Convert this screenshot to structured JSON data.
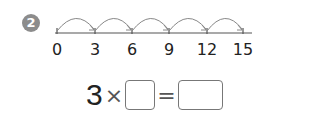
{
  "problem": {
    "number": "2"
  },
  "number_line": {
    "ticks": [
      "0",
      "3",
      "6",
      "9",
      "12",
      "15"
    ],
    "tick_x": [
      57,
      95,
      132,
      169,
      207,
      243
    ],
    "line_start_x": 55,
    "line_end_x": 252,
    "line_y": 33,
    "jumps": 5,
    "arc_color": "#888888",
    "line_color": "#555555"
  },
  "equation": {
    "factor": "3",
    "times_symbol": "×",
    "equals_symbol": "=",
    "blank1": "",
    "blank2": ""
  }
}
